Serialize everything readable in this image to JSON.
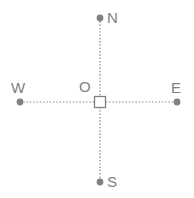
{
  "diagram": {
    "background_color": "#ffffff",
    "stroke_color": "#808080",
    "marker_fill_color": "#808080",
    "origin_fill_color": "#ffffff",
    "labels": {
      "north": "N",
      "south": "S",
      "west": "W",
      "east": "E",
      "origin": "O"
    },
    "points": {
      "north": {
        "x": 100,
        "y": 18
      },
      "south": {
        "x": 100,
        "y": 182
      },
      "west": {
        "x": 20,
        "y": 102
      },
      "east": {
        "x": 177,
        "y": 102
      },
      "origin": {
        "x": 100,
        "y": 102
      }
    },
    "lines": {
      "vertical": {
        "style": "dotted",
        "from": "north",
        "to": "south"
      },
      "horizontal": {
        "style": "dotted",
        "from": "west",
        "to": "east"
      }
    },
    "origin_marker": {
      "shape": "square",
      "size": 11
    },
    "endpoint_marker": {
      "shape": "circle",
      "radius": 3.5
    }
  }
}
